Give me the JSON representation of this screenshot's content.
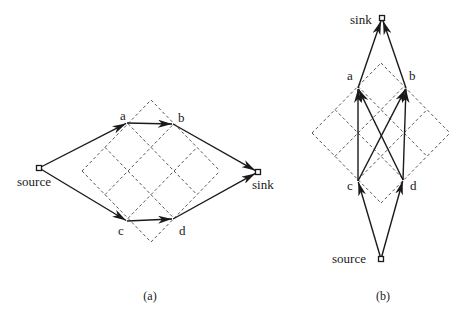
{
  "figure": {
    "panels": [
      {
        "id": "a",
        "caption": "(a)",
        "caption_pos": [
          150,
          300
        ],
        "lattice": {
          "center": [
            151,
            171
          ],
          "half_w": 69,
          "half_h": 71,
          "divisions": 3
        },
        "nodes": [
          {
            "id": "source",
            "label": "source",
            "x": 39,
            "y": 168,
            "terminal": true,
            "label_x": 17,
            "label_y": 186
          },
          {
            "id": "a",
            "label": "a",
            "x": 127,
            "y": 123,
            "terminal": false,
            "label_x": 120,
            "label_y": 120
          },
          {
            "id": "b",
            "label": "b",
            "x": 173,
            "y": 124,
            "terminal": false,
            "label_x": 178,
            "label_y": 122
          },
          {
            "id": "c",
            "label": "c",
            "x": 127,
            "y": 221,
            "terminal": false,
            "label_x": 118,
            "label_y": 235
          },
          {
            "id": "d",
            "label": "d",
            "x": 173,
            "y": 219,
            "terminal": false,
            "label_x": 179,
            "label_y": 235
          },
          {
            "id": "sink",
            "label": "sink",
            "x": 258,
            "y": 172,
            "terminal": true,
            "label_x": 252,
            "label_y": 189
          }
        ],
        "edges": [
          {
            "from": "source",
            "to": "a"
          },
          {
            "from": "source",
            "to": "c"
          },
          {
            "from": "a",
            "to": "b"
          },
          {
            "from": "c",
            "to": "d"
          },
          {
            "from": "b",
            "to": "sink"
          },
          {
            "from": "d",
            "to": "sink"
          }
        ]
      },
      {
        "id": "b",
        "caption": "(b)",
        "caption_pos": [
          383,
          300
        ],
        "lattice": {
          "center": [
            381,
            133
          ],
          "half_w": 69,
          "half_h": 70,
          "divisions": 3
        },
        "nodes": [
          {
            "id": "sink",
            "label": "sink",
            "x": 382,
            "y": 18,
            "terminal": true,
            "label_x": 350,
            "label_y": 24
          },
          {
            "id": "a",
            "label": "a",
            "x": 358,
            "y": 88,
            "terminal": false,
            "label_x": 347,
            "label_y": 80
          },
          {
            "id": "b",
            "label": "b",
            "x": 406,
            "y": 88,
            "terminal": false,
            "label_x": 409,
            "label_y": 80
          },
          {
            "id": "c",
            "label": "c",
            "x": 358,
            "y": 181,
            "terminal": false,
            "label_x": 347,
            "label_y": 190
          },
          {
            "id": "d",
            "label": "d",
            "x": 403,
            "y": 180,
            "terminal": false,
            "label_x": 410,
            "label_y": 190
          },
          {
            "id": "source",
            "label": "source",
            "x": 381,
            "y": 259,
            "terminal": true,
            "label_x": 332,
            "label_y": 263
          }
        ],
        "edges": [
          {
            "from": "source",
            "to": "c"
          },
          {
            "from": "source",
            "to": "d"
          },
          {
            "from": "c",
            "to": "a"
          },
          {
            "from": "c",
            "to": "b"
          },
          {
            "from": "d",
            "to": "a"
          },
          {
            "from": "d",
            "to": "b"
          },
          {
            "from": "a",
            "to": "sink"
          },
          {
            "from": "b",
            "to": "sink"
          }
        ]
      }
    ]
  }
}
